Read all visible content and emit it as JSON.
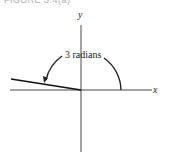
{
  "caption": "FIGURE 3.4(a)",
  "diagram": {
    "x_axis_label": "x",
    "y_axis_label": "y",
    "angle_label": "3 radians",
    "angle_radians": 3,
    "colors": {
      "line": "#222222",
      "background": "#ffffff"
    }
  }
}
